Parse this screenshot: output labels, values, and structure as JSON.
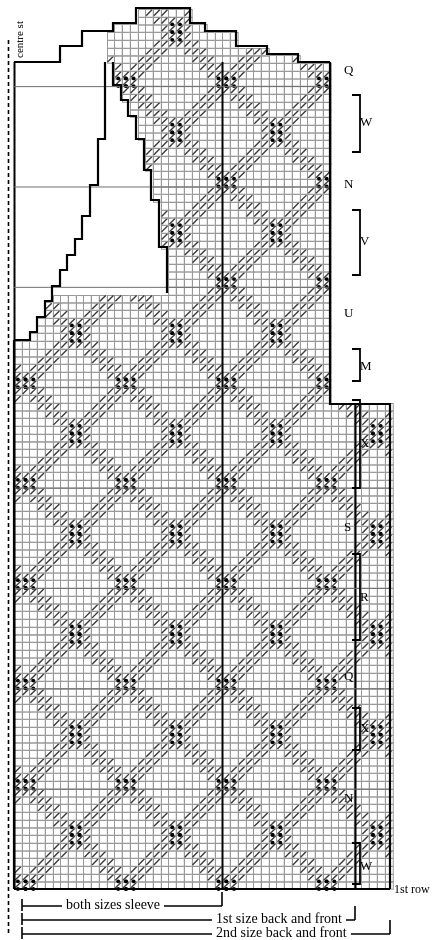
{
  "document": {
    "kind": "knitting-stitch-chart",
    "width": 442,
    "height": 940
  },
  "annotations": {
    "centre_stitch": "centre st",
    "first_row": "1st row"
  },
  "right_labels": [
    {
      "text": "Q",
      "y": 70,
      "bracket": false
    },
    {
      "text": "W",
      "y": 122,
      "bracket": true,
      "top": 95,
      "bottom": 152
    },
    {
      "text": "N",
      "y": 184,
      "bracket": false
    },
    {
      "text": "V",
      "y": 241,
      "bracket": true,
      "top": 210,
      "bottom": 275
    },
    {
      "text": "U",
      "y": 313,
      "bracket": false
    },
    {
      "text": "M",
      "y": 366,
      "bracket": true,
      "top": 349,
      "bottom": 381
    },
    {
      "text": "X",
      "y": 443,
      "bracket": true,
      "top": 400,
      "bottom": 488
    },
    {
      "text": "S",
      "y": 527,
      "bracket": false
    },
    {
      "text": "R",
      "y": 597,
      "bracket": true,
      "top": 554,
      "bottom": 640
    },
    {
      "text": "Q",
      "y": 676,
      "bracket": false
    },
    {
      "text": "X",
      "y": 728,
      "bracket": true,
      "top": 708,
      "bottom": 750
    },
    {
      "text": "N",
      "y": 798,
      "bracket": false
    },
    {
      "text": "W",
      "y": 866,
      "bracket": true,
      "top": 843,
      "bottom": 884
    }
  ],
  "bottom_legend": [
    {
      "text": "both sizes sleeve",
      "y": 906,
      "x_start": 22,
      "x_end": 222,
      "text_x": 62
    },
    {
      "text": "1st size back and front",
      "y": 920,
      "x_start": 22,
      "x_end": 355,
      "text_x": 212
    },
    {
      "text": "2nd size back and front",
      "y": 934,
      "x_start": 22,
      "x_end": 390,
      "text_x": 212
    }
  ],
  "colors": {
    "ink": "#000000",
    "grid_line": "#999999",
    "grid_line_major": "#6f6f6f",
    "background": "#ffffff",
    "texture": "#3a3a3a"
  },
  "grid": {
    "cell_w": 7.72,
    "cell_h": 7.72,
    "origin_x": 14,
    "bottom_y": 889,
    "cols": 49,
    "rows": 115,
    "heavy_cols": [
      0,
      44,
      49
    ],
    "sleeve_dashed_x": 8
  },
  "chart_data": {
    "type": "heatmap",
    "xlabel": "stitches",
    "ylabel": "rows",
    "symbols": {
      "blank": "stocking stitch / plain",
      "diagonal": "travelling stitch band (right slant)",
      "bobble4": "four-dot bobble cluster",
      "outline": "garment shaping outline"
    },
    "lattice": {
      "period_cols": 13,
      "period_rows": 26,
      "band_width": 3,
      "bobble_cols": [
        2,
        15,
        28,
        41,
        8,
        21,
        34,
        47
      ],
      "bobble_row_period": 13
    },
    "outline_path_top": [
      [
        14,
        62
      ],
      [
        60,
        62
      ],
      [
        60,
        46
      ],
      [
        82,
        46
      ],
      [
        82,
        31
      ],
      [
        113,
        31
      ],
      [
        113,
        23
      ],
      [
        136,
        23
      ],
      [
        136,
        8
      ],
      [
        190,
        8
      ],
      [
        190,
        23
      ],
      [
        205,
        23
      ],
      [
        205,
        31
      ],
      [
        236,
        31
      ],
      [
        236,
        46
      ],
      [
        267,
        46
      ],
      [
        267,
        54
      ],
      [
        298,
        54
      ],
      [
        298,
        62
      ],
      [
        330,
        62
      ]
    ],
    "outline_neck_inner": [
      [
        113,
        62
      ],
      [
        113,
        85
      ],
      [
        121,
        85
      ],
      [
        121,
        100
      ],
      [
        128,
        100
      ],
      [
        128,
        116
      ],
      [
        136,
        116
      ],
      [
        136,
        139
      ],
      [
        144,
        139
      ],
      [
        144,
        170
      ],
      [
        151,
        170
      ],
      [
        151,
        200
      ],
      [
        159,
        200
      ],
      [
        159,
        247
      ],
      [
        167,
        247
      ],
      [
        167,
        293
      ]
    ],
    "armhole_steps": [
      [
        14,
        340
      ],
      [
        30,
        340
      ],
      [
        30,
        332
      ],
      [
        37,
        332
      ],
      [
        37,
        317
      ],
      [
        45,
        317
      ],
      [
        45,
        301
      ],
      [
        52,
        301
      ],
      [
        52,
        286
      ],
      [
        60,
        286
      ],
      [
        60,
        270
      ],
      [
        67,
        270
      ],
      [
        67,
        255
      ],
      [
        75,
        255
      ],
      [
        75,
        239
      ],
      [
        82,
        239
      ],
      [
        82,
        216
      ],
      [
        90,
        216
      ],
      [
        90,
        185
      ],
      [
        98,
        185
      ],
      [
        98,
        139
      ],
      [
        105,
        139
      ],
      [
        105,
        62
      ]
    ],
    "body_step": {
      "x_upper_right": 330,
      "x_lower_right": 390,
      "y": 404
    },
    "regions": [
      {
        "name": "sleeve",
        "x0": 14,
        "x1": 222,
        "y0": 62,
        "y1": 889
      },
      {
        "name": "first-size-body",
        "x0": 14,
        "x1": 355,
        "y0": 404,
        "y1": 889
      },
      {
        "name": "second-size-body",
        "x0": 14,
        "x1": 390,
        "y0": 404,
        "y1": 889
      }
    ]
  }
}
